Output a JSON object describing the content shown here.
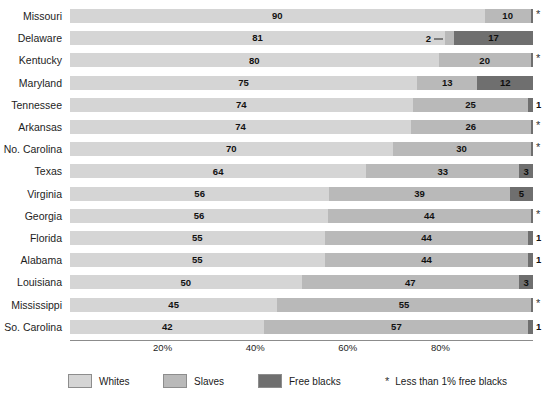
{
  "chart_data": {
    "type": "bar",
    "subtype": "stacked-horizontal-100pct",
    "title": "",
    "xlabel": "",
    "ylabel": "",
    "xlim": [
      0,
      100
    ],
    "grid": false,
    "legend_position": "bottom",
    "categories": [
      "Missouri",
      "Delaware",
      "Kentucky",
      "Maryland",
      "Tennessee",
      "Arkansas",
      "No. Carolina",
      "Texas",
      "Virginia",
      "Georgia",
      "Florida",
      "Alabama",
      "Louisiana",
      "Mississippi",
      "So. Carolina"
    ],
    "series": [
      {
        "name": "Whites",
        "color": "#d5d5d5",
        "values": [
          90,
          81,
          80,
          75,
          74,
          74,
          70,
          64,
          56,
          56,
          55,
          55,
          50,
          45,
          42
        ]
      },
      {
        "name": "Slaves",
        "color": "#b9b9b9",
        "values": [
          10,
          2,
          20,
          13,
          25,
          26,
          30,
          33,
          39,
          44,
          44,
          44,
          47,
          55,
          57
        ]
      },
      {
        "name": "Free blacks",
        "color": "#6f6f6f",
        "values": [
          0.5,
          17,
          0.5,
          12,
          1,
          0.5,
          0.5,
          3,
          5,
          0.5,
          1,
          1,
          3,
          0.5,
          1
        ]
      }
    ],
    "tick_labels": [
      "20%",
      "40%",
      "60%",
      "80%"
    ],
    "tick_values": [
      20,
      40,
      60,
      80
    ],
    "annotations": {
      "asterisk_note": "* Less than 1% free blacks"
    }
  },
  "rows": [
    {
      "label": "Missouri",
      "whites": 90,
      "slaves": 10,
      "free": 0.5,
      "whites_text": "90",
      "slaves_text": "10",
      "free_text": "",
      "note": "*",
      "note_type": "asterisk",
      "slaves_callout": false
    },
    {
      "label": "Delaware",
      "whites": 81,
      "slaves": 2,
      "free": 17,
      "whites_text": "81",
      "slaves_text": "2",
      "free_text": "17",
      "note": "",
      "note_type": "none",
      "slaves_callout": true
    },
    {
      "label": "Kentucky",
      "whites": 80,
      "slaves": 20,
      "free": 0.5,
      "whites_text": "80",
      "slaves_text": "20",
      "free_text": "",
      "note": "*",
      "note_type": "asterisk",
      "slaves_callout": false
    },
    {
      "label": "Maryland",
      "whites": 75,
      "slaves": 13,
      "free": 12,
      "whites_text": "75",
      "slaves_text": "13",
      "free_text": "12",
      "note": "",
      "note_type": "none",
      "slaves_callout": false
    },
    {
      "label": "Tennessee",
      "whites": 74,
      "slaves": 25,
      "free": 1,
      "whites_text": "74",
      "slaves_text": "25",
      "free_text": "",
      "note": "1",
      "note_type": "value",
      "slaves_callout": false
    },
    {
      "label": "Arkansas",
      "whites": 74,
      "slaves": 26,
      "free": 0.5,
      "whites_text": "74",
      "slaves_text": "26",
      "free_text": "",
      "note": "*",
      "note_type": "asterisk",
      "slaves_callout": false
    },
    {
      "label": "No. Carolina",
      "whites": 70,
      "slaves": 30,
      "free": 0.5,
      "whites_text": "70",
      "slaves_text": "30",
      "free_text": "",
      "note": "*",
      "note_type": "asterisk",
      "slaves_callout": false
    },
    {
      "label": "Texas",
      "whites": 64,
      "slaves": 33,
      "free": 3,
      "whites_text": "64",
      "slaves_text": "33",
      "free_text": "3",
      "note": "",
      "note_type": "none",
      "slaves_callout": false
    },
    {
      "label": "Virginia",
      "whites": 56,
      "slaves": 39,
      "free": 5,
      "whites_text": "56",
      "slaves_text": "39",
      "free_text": "5",
      "note": "",
      "note_type": "none",
      "slaves_callout": false
    },
    {
      "label": "Georgia",
      "whites": 56,
      "slaves": 44,
      "free": 0.5,
      "whites_text": "56",
      "slaves_text": "44",
      "free_text": "",
      "note": "*",
      "note_type": "asterisk",
      "slaves_callout": false
    },
    {
      "label": "Florida",
      "whites": 55,
      "slaves": 44,
      "free": 1,
      "whites_text": "55",
      "slaves_text": "44",
      "free_text": "",
      "note": "1",
      "note_type": "value",
      "slaves_callout": false
    },
    {
      "label": "Alabama",
      "whites": 55,
      "slaves": 44,
      "free": 1,
      "whites_text": "55",
      "slaves_text": "44",
      "free_text": "",
      "note": "1",
      "note_type": "value",
      "slaves_callout": false
    },
    {
      "label": "Louisiana",
      "whites": 50,
      "slaves": 47,
      "free": 3,
      "whites_text": "50",
      "slaves_text": "47",
      "free_text": "3",
      "note": "",
      "note_type": "none",
      "slaves_callout": false
    },
    {
      "label": "Mississippi",
      "whites": 45,
      "slaves": 55,
      "free": 0.5,
      "whites_text": "45",
      "slaves_text": "55",
      "free_text": "",
      "note": "*",
      "note_type": "asterisk",
      "slaves_callout": false
    },
    {
      "label": "So. Carolina",
      "whites": 42,
      "slaves": 57,
      "free": 1,
      "whites_text": "42",
      "slaves_text": "57",
      "free_text": "",
      "note": "1",
      "note_type": "value",
      "slaves_callout": false
    }
  ],
  "axis": {
    "ticks": [
      {
        "label": "20%",
        "value": 20
      },
      {
        "label": "40%",
        "value": 40
      },
      {
        "label": "60%",
        "value": 60
      },
      {
        "label": "80%",
        "value": 80
      }
    ]
  },
  "legend": {
    "items": [
      {
        "label": "Whites",
        "color": "#d5d5d5",
        "left": 68
      },
      {
        "label": "Slaves",
        "color": "#b9b9b9",
        "left": 163
      },
      {
        "label": "Free blacks",
        "color": "#6f6f6f",
        "left": 258
      }
    ],
    "asterisk_symbol": "*",
    "asterisk_label": "Less than 1% free blacks",
    "asterisk_left": 385
  }
}
